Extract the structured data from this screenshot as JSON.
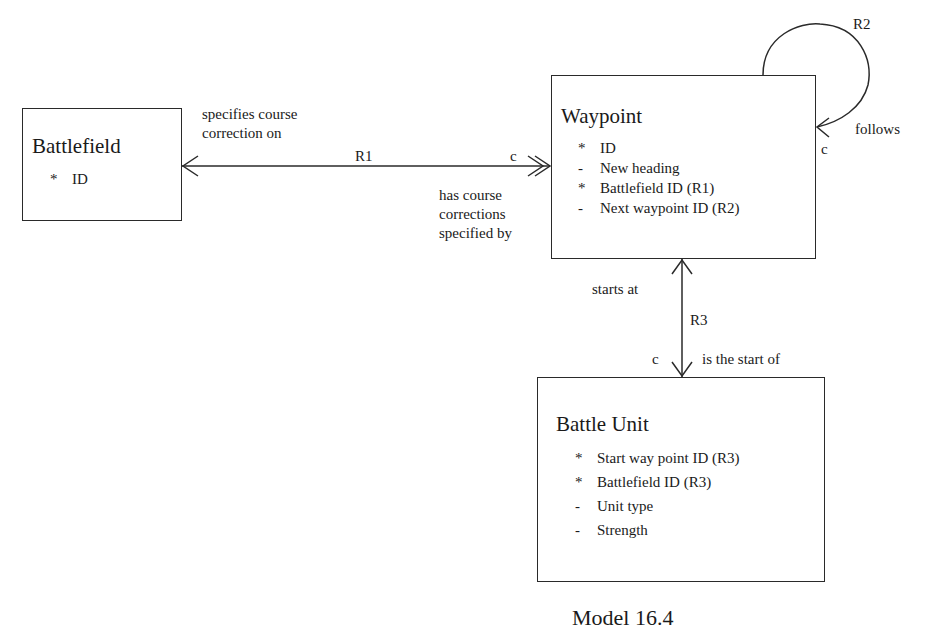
{
  "entities": {
    "battlefield": {
      "name": "Battlefield",
      "attributes": [
        {
          "mark": "*",
          "text": "ID"
        }
      ]
    },
    "waypoint": {
      "name": "Waypoint",
      "attributes": [
        {
          "mark": "*",
          "text": "ID"
        },
        {
          "mark": "-",
          "text": "New heading"
        },
        {
          "mark": "*",
          "text": "Battlefield ID  (R1)"
        },
        {
          "mark": "-",
          "text": "Next waypoint ID (R2)"
        }
      ]
    },
    "battle_unit": {
      "name": "Battle Unit",
      "attributes": [
        {
          "mark": "*",
          "text": "Start way point ID (R3)"
        },
        {
          "mark": "*",
          "text": "Battlefield ID (R3)"
        },
        {
          "mark": "-",
          "text": "Unit type"
        },
        {
          "mark": "-",
          "text": "Strength"
        }
      ]
    }
  },
  "relationships": {
    "r1": {
      "id": "R1",
      "left_phrase_line1": "specifies course",
      "left_phrase_line2": "correction on",
      "right_phrase_line1": "has course",
      "right_phrase_line2": "corrections",
      "right_phrase_line3": "specified by",
      "conditionality": "c"
    },
    "r2": {
      "id": "R2",
      "phrase": "follows",
      "conditionality": "c"
    },
    "r3": {
      "id": "R3",
      "top_phrase": "starts at",
      "bottom_phrase": "is the start of",
      "conditionality": "c"
    }
  },
  "caption": "Model 16.4"
}
